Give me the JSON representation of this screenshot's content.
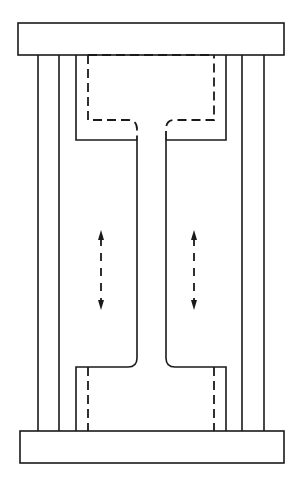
{
  "diagram": {
    "type": "mechanical cross-section",
    "stroke_color": "#1a1a1a",
    "background": "#ffffff",
    "top_plate": {
      "x": 18,
      "y": 23,
      "w": 266,
      "h": 32
    },
    "bottom_plate": {
      "x": 20,
      "y": 431,
      "w": 264,
      "h": 32
    },
    "outer_columns_left": [
      38,
      59
    ],
    "outer_columns_right": [
      242,
      264
    ],
    "solid_frame": {
      "left": 76,
      "right": 226,
      "top_bottom_y": 140,
      "bottom_top_y": 367
    },
    "dashed_box_top": {
      "left": 88,
      "right": 214,
      "top": 55,
      "bottom": 120
    },
    "dashed_box_bottom": {
      "left": 88,
      "right": 214,
      "top": 367,
      "bottom": 431
    },
    "stem": {
      "left": 137,
      "right": 166
    },
    "arrows": [
      {
        "name": "left-flow-arrow",
        "x": 101,
        "y1": 230,
        "y2": 310,
        "directions": [
          "up",
          "down"
        ]
      },
      {
        "name": "right-flow-arrow",
        "x": 194,
        "y1": 230,
        "y2": 310,
        "directions": [
          "up",
          "down"
        ]
      }
    ]
  }
}
